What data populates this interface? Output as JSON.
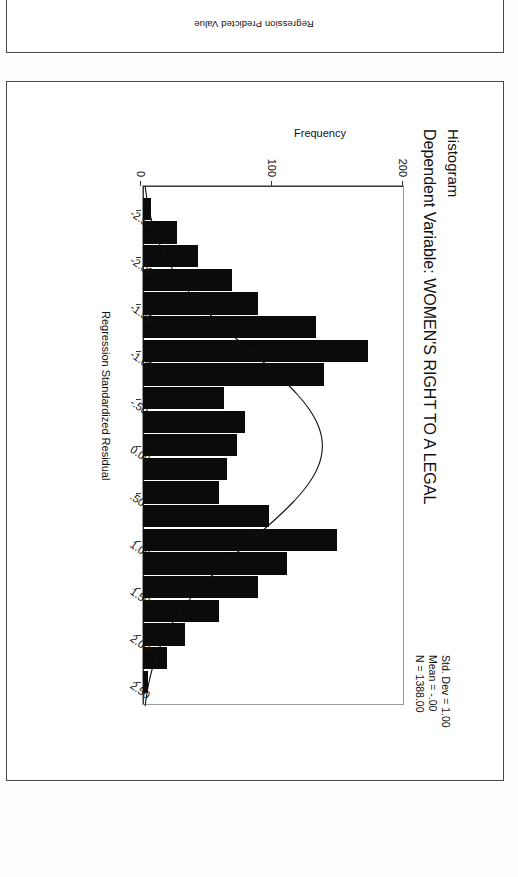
{
  "page": {
    "background_color": "#ffffff",
    "border_color": "#4a4a4a",
    "rotated_180": "true"
  },
  "top_panel": {
    "stray_axis_label": "Regression Predicted Value"
  },
  "chart_data": {
    "type": "bar",
    "title": "Histogram",
    "subtitle": "Dependent Variable: WOMEN'S RIGHT TO A LEGAL",
    "xlabel": "Regression Standardized Residual",
    "ylabel": "Frequency",
    "xlim": [
      -2.75,
      2.75
    ],
    "ylim": [
      0,
      200
    ],
    "ytick_labels": [
      "0",
      "100",
      "200"
    ],
    "ytick_values": [
      0,
      100,
      200
    ],
    "xtick_labels": [
      "-2.50",
      "-2.00",
      "-1.50",
      "-1.00",
      "-.50",
      "0.00",
      ".50",
      "1.00",
      "1.50",
      "2.00",
      "2.50"
    ],
    "xtick_values": [
      -2.5,
      -2.0,
      -1.5,
      -1.0,
      -0.5,
      0.0,
      0.5,
      1.0,
      1.5,
      2.0,
      2.5
    ],
    "grid": "off",
    "legend": "none",
    "bar_color": "#0b0b0b",
    "curve": "normal",
    "bin_width": 0.25,
    "categories": [
      -2.5,
      -2.25,
      -2.0,
      -1.75,
      -1.5,
      -1.25,
      -1.0,
      -0.75,
      -0.5,
      -0.25,
      0.0,
      0.25,
      0.5,
      0.75,
      1.0,
      1.25,
      1.5,
      1.75,
      2.0,
      2.25,
      2.5
    ],
    "values": [
      6,
      26,
      42,
      68,
      88,
      132,
      172,
      138,
      62,
      78,
      72,
      64,
      58,
      96,
      148,
      110,
      88,
      58,
      32,
      18,
      4
    ],
    "annotations": {
      "std_dev": "Std. Dev = 1.00",
      "mean": "Mean = -.00",
      "n": "N = 1388.00"
    }
  }
}
